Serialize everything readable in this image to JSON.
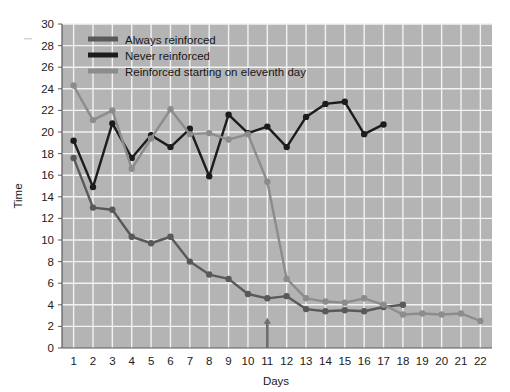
{
  "chart_data": {
    "type": "line",
    "title": "",
    "xlabel": "Days",
    "ylabel": "Time",
    "x": [
      1,
      2,
      3,
      4,
      5,
      6,
      7,
      8,
      9,
      10,
      11,
      12,
      13,
      14,
      15,
      16,
      17,
      18,
      19,
      20,
      21,
      22
    ],
    "xlim": [
      0.4,
      22.6
    ],
    "ylim": [
      0,
      30
    ],
    "xticks": [
      "1",
      "2",
      "3",
      "4",
      "5",
      "6",
      "7",
      "8",
      "9",
      "10",
      "11",
      "12",
      "13",
      "14",
      "15",
      "16",
      "17",
      "18",
      "19",
      "20",
      "21",
      "22"
    ],
    "yticks": [
      "0",
      "2",
      "4",
      "6",
      "8",
      "10",
      "12",
      "14",
      "16",
      "18",
      "20",
      "22",
      "24",
      "26",
      "28",
      "30"
    ],
    "grid": true,
    "legend_position": "top-left",
    "plot_background": "#b4b4b4",
    "grid_color": "#f2f2f2",
    "series": [
      {
        "name": "Always reinforced",
        "color": "#595959",
        "x": [
          1,
          2,
          3,
          4,
          5,
          6,
          7,
          8,
          9,
          10,
          11,
          12,
          13,
          14,
          15,
          16,
          17,
          18
        ],
        "values": [
          17.6,
          13.0,
          12.8,
          10.3,
          9.7,
          10.3,
          8.0,
          6.8,
          6.4,
          5.0,
          4.6,
          4.8,
          3.6,
          3.4,
          3.5,
          3.4,
          3.8,
          4.0
        ]
      },
      {
        "name": "Never reinforced",
        "color": "#1c1c1c",
        "x": [
          1,
          2,
          3,
          4,
          5,
          6,
          7,
          8,
          9,
          10,
          11,
          12,
          13,
          14,
          15,
          16,
          17
        ],
        "values": [
          19.2,
          14.9,
          20.8,
          17.6,
          19.7,
          18.6,
          20.3,
          15.9,
          21.6,
          19.9,
          20.5,
          18.6,
          21.4,
          22.6,
          22.8,
          19.8,
          20.7
        ]
      },
      {
        "name": "Reinforced starting on eleventh day",
        "color": "#8c8c8c",
        "x": [
          1,
          2,
          3,
          4,
          5,
          6,
          7,
          8,
          9,
          10,
          11,
          12,
          13,
          14,
          15,
          16,
          17,
          18,
          19,
          20,
          21,
          22
        ],
        "values": [
          24.3,
          21.1,
          22.0,
          16.6,
          19.4,
          22.1,
          19.8,
          19.9,
          19.3,
          19.8,
          15.4,
          6.4,
          4.6,
          4.3,
          4.2,
          4.6,
          4.0,
          3.1,
          3.2,
          3.1,
          3.2,
          2.5
        ]
      }
    ],
    "annotation": {
      "name": "arrow-marker-day-11",
      "x": 11,
      "y_from": 0,
      "y_to": 2.7,
      "color": "#6e6e6e"
    }
  }
}
